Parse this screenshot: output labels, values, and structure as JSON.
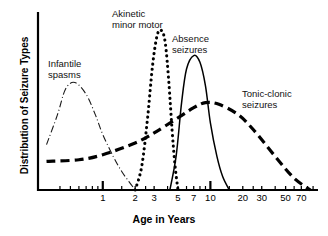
{
  "chart_data": {
    "type": "line",
    "title": "",
    "subtitle": "",
    "xlabel": "Age in Years",
    "ylabel": "Distribution of Seizure Types",
    "xscale": "log",
    "xlim": [
      0.25,
      100
    ],
    "ylim": [
      0,
      1
    ],
    "grid": false,
    "legend_position": "inline-annotations",
    "xticks": [
      1,
      2,
      3,
      5,
      7,
      10,
      20,
      30,
      50,
      70
    ],
    "xticklabels": [
      "1",
      "2",
      "3",
      "5",
      "7",
      "10",
      "20",
      "30",
      "50",
      "70"
    ],
    "yticks": [],
    "yticklabels": [],
    "series": [
      {
        "name": "Infantile spasms",
        "linestyle": "dashdot",
        "color": "#1a1a1a",
        "peak_age": 0.5,
        "x": [
          0.3,
          0.38,
          0.45,
          0.55,
          0.7,
          0.85,
          1.0,
          1.25,
          1.5,
          1.75,
          2.0
        ],
        "y": [
          0.27,
          0.45,
          0.6,
          0.64,
          0.57,
          0.45,
          0.33,
          0.2,
          0.11,
          0.05,
          0.0
        ]
      },
      {
        "name": "Akinetic minor motor",
        "linestyle": "dotted",
        "color": "#000000",
        "peak_age": 3.5,
        "x": [
          2.0,
          2.3,
          2.6,
          2.9,
          3.2,
          3.5,
          3.8,
          4.1,
          4.4,
          4.7,
          5.0
        ],
        "y": [
          0.0,
          0.14,
          0.42,
          0.74,
          0.92,
          0.95,
          0.88,
          0.65,
          0.36,
          0.14,
          0.0
        ]
      },
      {
        "name": "Absence seizures",
        "linestyle": "solid",
        "color": "#000000",
        "peak_age": 7.0,
        "x": [
          4.2,
          4.8,
          5.4,
          6.0,
          7.0,
          8.0,
          9.0,
          10.0,
          11.5,
          13.0,
          15.0
        ],
        "y": [
          0.0,
          0.2,
          0.52,
          0.72,
          0.8,
          0.76,
          0.62,
          0.4,
          0.2,
          0.08,
          0.0
        ]
      },
      {
        "name": "Tonic-clonic seizures",
        "linestyle": "dashed",
        "color": "#000000",
        "peak_age": 9.0,
        "x": [
          0.3,
          0.6,
          1.0,
          2.0,
          3.0,
          5.0,
          7.0,
          9.0,
          12.0,
          18.0,
          25.0,
          40.0,
          60.0,
          85.0
        ],
        "y": [
          0.17,
          0.18,
          0.21,
          0.28,
          0.34,
          0.43,
          0.49,
          0.52,
          0.51,
          0.45,
          0.36,
          0.2,
          0.07,
          0.0
        ]
      }
    ],
    "annotations": [
      {
        "id": "infantile",
        "line1": "Infantile",
        "line2": "spasms"
      },
      {
        "id": "akinetic",
        "line1": "Akinetic",
        "line2": "minor motor"
      },
      {
        "id": "absence",
        "line1": "Absence",
        "line2": "seizures"
      },
      {
        "id": "tonic",
        "line1": "Tonic-clonic",
        "line2": "seizures"
      }
    ]
  },
  "axes": {
    "xlabel": "Age in Years",
    "ylabel": "Distribution of Seizure Types",
    "ticks": [
      {
        "value": "1"
      },
      {
        "value": "2"
      },
      {
        "value": "3"
      },
      {
        "value": "5"
      },
      {
        "value": "7"
      },
      {
        "value": "10"
      },
      {
        "value": "20"
      },
      {
        "value": "30"
      },
      {
        "value": "50"
      },
      {
        "value": "70"
      }
    ]
  }
}
